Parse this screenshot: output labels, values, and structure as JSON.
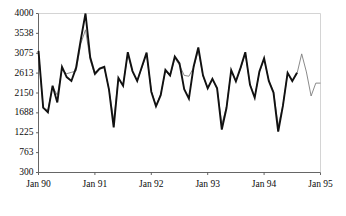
{
  "chart_data": {
    "type": "line",
    "title": "",
    "xlabel": "",
    "ylabel": "",
    "grid": false,
    "legend_position": "none",
    "ylim": [
      300,
      4000
    ],
    "ytick_labels": [
      "300",
      "763",
      "1225",
      "1688",
      "2150",
      "2613",
      "3075",
      "3538",
      "4000"
    ],
    "ytick_values": [
      300,
      763,
      1225,
      1688,
      2150,
      2613,
      3075,
      3538,
      4000
    ],
    "xtick_labels": [
      "Jan 90",
      "Jan 91",
      "Jan 92",
      "Jan 93",
      "Jan 94",
      "Jan 95"
    ],
    "xtick_values": [
      0,
      12,
      24,
      36,
      48,
      60
    ],
    "xlim": [
      0,
      60
    ],
    "series": [
      {
        "name": "actual",
        "color": "#111111",
        "width": 1.9,
        "x": [
          0,
          1,
          2,
          3,
          4,
          5,
          6,
          7,
          8,
          9,
          10,
          11,
          12,
          13,
          14,
          15,
          16,
          17,
          18,
          19,
          20,
          21,
          22,
          23,
          24,
          25,
          26,
          27,
          28,
          29,
          30,
          31,
          32,
          33,
          34,
          35,
          36,
          37,
          38,
          39,
          40,
          41,
          42,
          43,
          44,
          45,
          46,
          47,
          48,
          49,
          50,
          51,
          52,
          53,
          54,
          55
        ],
        "values": [
          3130,
          1810,
          1700,
          2320,
          1930,
          2760,
          2520,
          2430,
          2740,
          3390,
          4000,
          2980,
          2600,
          2720,
          2760,
          2230,
          1350,
          2500,
          2320,
          3100,
          2660,
          2430,
          2760,
          3090,
          2180,
          1840,
          2100,
          2690,
          2560,
          3000,
          2840,
          2240,
          2020,
          2760,
          3210,
          2560,
          2260,
          2480,
          2260,
          1300,
          1800,
          2680,
          2420,
          2740,
          3100,
          2340,
          2040,
          2650,
          2960,
          2430,
          2160,
          1250,
          1850,
          2620,
          2430,
          2620
        ]
      },
      {
        "name": "fitted-forecast",
        "color": "#7d7d7d",
        "width": 0.9,
        "x": [
          0,
          1,
          2,
          3,
          4,
          5,
          6,
          7,
          8,
          9,
          10,
          11,
          12,
          13,
          14,
          15,
          16,
          17,
          18,
          19,
          20,
          21,
          22,
          23,
          24,
          25,
          26,
          27,
          28,
          29,
          30,
          31,
          32,
          33,
          34,
          35,
          36,
          37,
          38,
          39,
          40,
          41,
          42,
          43,
          44,
          45,
          46,
          47,
          48,
          49,
          50,
          51,
          52,
          53,
          54,
          55,
          56,
          57,
          58,
          59,
          60
        ],
        "values": [
          3100,
          1790,
          1760,
          2300,
          2100,
          2700,
          2600,
          2630,
          2660,
          3300,
          3620,
          2920,
          2560,
          2700,
          2740,
          2230,
          1520,
          2490,
          2330,
          3060,
          2640,
          2440,
          2740,
          3060,
          2200,
          1860,
          2120,
          2660,
          2540,
          2960,
          2800,
          2560,
          2540,
          2740,
          3140,
          2540,
          2260,
          2460,
          2270,
          1420,
          1830,
          2660,
          2430,
          2720,
          3060,
          2360,
          2060,
          2630,
          2930,
          2440,
          2180,
          1390,
          1860,
          2600,
          2440,
          2600,
          3060,
          2640,
          2080,
          2380,
          2380
        ]
      }
    ]
  }
}
